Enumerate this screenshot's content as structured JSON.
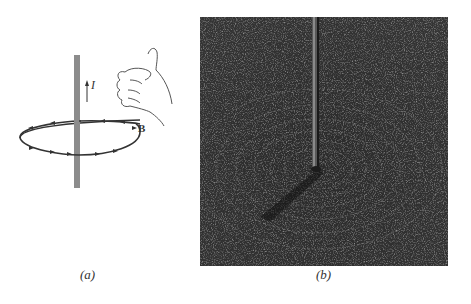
{
  "figure": {
    "panel_a": {
      "caption": "(a)",
      "current_label": "I",
      "field_label": "B",
      "wire_color": "#8c8c8c",
      "loop_color": "#333333"
    },
    "panel_b": {
      "caption": "(b)",
      "photo_bg": "#2f2f2f"
    }
  }
}
